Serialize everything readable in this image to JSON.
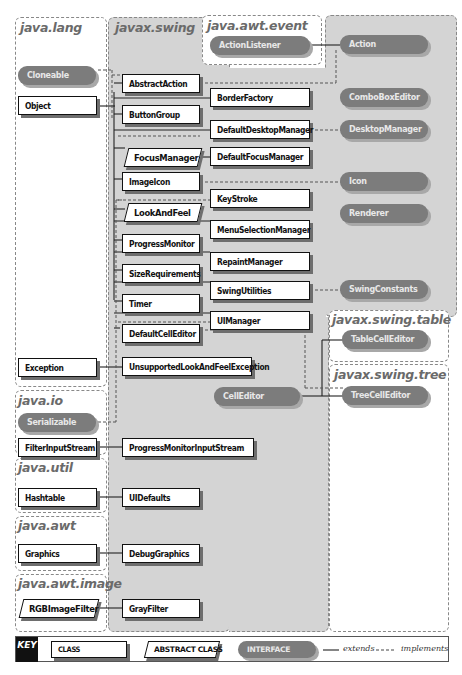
{
  "packages": {
    "java_lang": "java.lang",
    "javax_swing": "javax.swing",
    "java_awt_event": "java.awt.event",
    "javax_swing_table": "javax.swing.table",
    "javax_swing_tree": "javax.swing.tree",
    "java_io": "java.io",
    "java_util": "java.util",
    "java_awt": "java.awt",
    "java_awt_image": "java.awt.image"
  },
  "classes": {
    "Object": "Object",
    "Exception": "Exception",
    "FilterInputStream": "FilterInputStream",
    "Hashtable": "Hashtable",
    "Graphics": "Graphics",
    "AbstractAction": "AbstractAction",
    "ButtonGroup": "ButtonGroup",
    "ImageIcon": "ImageIcon",
    "ProgressMonitor": "ProgressMonitor",
    "SizeRequirements": "SizeRequirements",
    "Timer": "Timer",
    "DefaultCellEditor": "DefaultCellEditor",
    "UnsupportedLookAndFeelException": "UnsupportedLookAndFeelException",
    "ProgressMonitorInputStream": "ProgressMonitorInputStream",
    "UIDefaults": "UIDefaults",
    "DebugGraphics": "DebugGraphics",
    "GrayFilter": "GrayFilter",
    "BorderFactory": "BorderFactory",
    "DefaultDesktopManager": "DefaultDesktopManager",
    "DefaultFocusManager": "DefaultFocusManager",
    "KeyStroke": "KeyStroke",
    "MenuSelectionManager": "MenuSelectionManager",
    "RepaintManager": "RepaintManager",
    "SwingUtilities": "SwingUtilities",
    "UIManager": "UIManager"
  },
  "abstract_classes": {
    "FocusManager": "FocusManager",
    "LookAndFeel": "LookAndFeel",
    "RGBImageFilter": "RGBImageFilter"
  },
  "interfaces": {
    "Cloneable": "Cloneable",
    "Serializable": "Serializable",
    "ActionListener": "ActionListener",
    "Action": "Action",
    "ComboBoxEditor": "ComboBoxEditor",
    "DesktopManager": "DesktopManager",
    "Icon": "Icon",
    "Renderer": "Renderer",
    "SwingConstants": "SwingConstants",
    "CellEditor": "CellEditor",
    "TableCellEditor": "TableCellEditor",
    "TreeCellEditor": "TreeCellEditor"
  },
  "key": {
    "label": "KEY",
    "class": "CLASS",
    "abstract_class": "ABSTRACT CLASS",
    "interface": "INTERFACE",
    "extends": "extends",
    "implements": "implements"
  },
  "colors": {
    "swing_region": "#d4d4d4",
    "interface_fill": "#7c7c7c",
    "class_border": "#111111",
    "package_title": "#6a6a6a"
  }
}
